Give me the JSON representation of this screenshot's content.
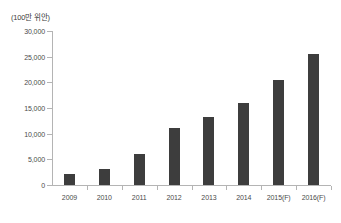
{
  "chart_data": {
    "type": "bar",
    "title": "",
    "subtitle": "",
    "unit_label": "(100만 위안)",
    "xlabel": "",
    "ylabel": "",
    "categories": [
      "2009",
      "2010",
      "2011",
      "2012",
      "2013",
      "2014",
      "2015(F)",
      "2016(F)"
    ],
    "values": [
      2200,
      3100,
      6000,
      11100,
      13200,
      15900,
      20500,
      25600
    ],
    "ylim": [
      0,
      30000
    ],
    "ytick_values": [
      0,
      5000,
      10000,
      15000,
      20000,
      25000,
      30000
    ],
    "ytick_labels": [
      "0",
      "5,000",
      "10,000",
      "15,000",
      "20,000",
      "25,000",
      "30,000"
    ],
    "grid": false,
    "legend": false,
    "legend_position": "none",
    "series": [
      {
        "name": "",
        "values": [
          2200,
          3100,
          6000,
          11100,
          13200,
          15900,
          20500,
          25600
        ]
      }
    ],
    "colors": {
      "bar": "#3d3d3d",
      "axis": "#b4b4b4",
      "text": "#4a4a4a",
      "background": "#ffffff"
    }
  }
}
